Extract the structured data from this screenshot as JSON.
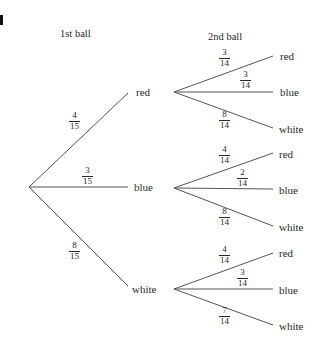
{
  "figure_label": "a",
  "headers": {
    "first": "1st ball",
    "second": "2nd ball"
  },
  "first_level": [
    {
      "label": "red",
      "prob": {
        "num": "4",
        "den": "15"
      }
    },
    {
      "label": "blue",
      "prob": {
        "num": "3",
        "den": "15"
      }
    },
    {
      "label": "white",
      "prob": {
        "num": "8",
        "den": "15"
      }
    }
  ],
  "second_level": [
    {
      "parent": "red",
      "branches": [
        {
          "label": "red",
          "prob": {
            "num": "3",
            "den": "14"
          }
        },
        {
          "label": "blue",
          "prob": {
            "num": "3",
            "den": "14"
          }
        },
        {
          "label": "white",
          "prob": {
            "num": "8",
            "den": "14"
          }
        }
      ]
    },
    {
      "parent": "blue",
      "branches": [
        {
          "label": "red",
          "prob": {
            "num": "4",
            "den": "14"
          }
        },
        {
          "label": "blue",
          "prob": {
            "num": "2",
            "den": "14"
          }
        },
        {
          "label": "white",
          "prob": {
            "num": "8",
            "den": "14"
          }
        }
      ]
    },
    {
      "parent": "white",
      "branches": [
        {
          "label": "red",
          "prob": {
            "num": "4",
            "den": "14"
          }
        },
        {
          "label": "blue",
          "prob": {
            "num": "3",
            "den": "14"
          }
        },
        {
          "label": "white",
          "prob": {
            "num": "7",
            "den": "14"
          }
        }
      ]
    }
  ],
  "colors": {
    "ink": "#2a2a2a",
    "background": "#ffffff"
  }
}
